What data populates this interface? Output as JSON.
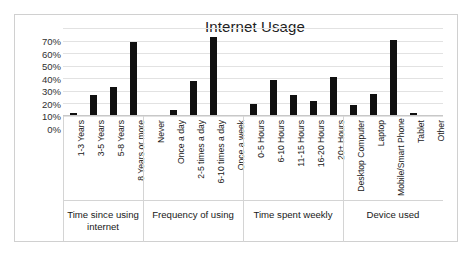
{
  "chart_data": {
    "type": "bar",
    "title": "Internet Usage",
    "xlabel": "",
    "ylabel": "",
    "ylim": [
      0,
      70
    ],
    "ytick_labels": [
      "70%",
      "60%",
      "50%",
      "40%",
      "30%",
      "20%",
      "10%",
      "0%"
    ],
    "ytick_values": [
      70,
      60,
      50,
      40,
      30,
      20,
      10,
      0
    ],
    "grid": true,
    "legend": "none",
    "bar_color": "#101010",
    "categories": [
      "1-3 Years",
      "3-5 Years",
      "5-8 Years",
      "8 Years or more",
      "Never",
      "Once a day",
      "2-5 times a day",
      "6-10 times a day",
      "Once a week",
      "0-5 Hours",
      "6-10 Hours",
      "11-15 Hours",
      "16-20 Hours",
      "20+ Hours",
      "Desktop Computer",
      "Laptop",
      "Mobile/Smart Phone",
      "Tablet",
      "Other"
    ],
    "values": [
      1,
      16,
      22,
      58,
      0,
      4,
      27,
      62,
      0,
      9,
      28,
      16,
      11,
      30,
      8,
      17,
      60,
      2,
      0
    ],
    "groups": [
      {
        "label": "Time since using internet",
        "start": 0,
        "count": 4
      },
      {
        "label": "Frequency of using",
        "start": 4,
        "count": 5
      },
      {
        "label": "Time spent weekly",
        "start": 9,
        "count": 5
      },
      {
        "label": "Device used",
        "start": 14,
        "count": 5
      }
    ]
  }
}
